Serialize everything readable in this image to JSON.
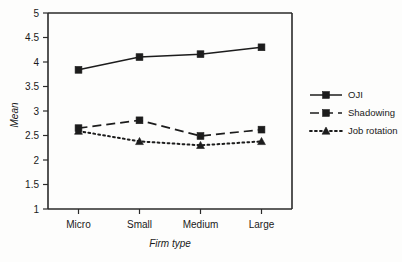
{
  "chart_data": {
    "type": "line",
    "title": "",
    "subtitle": "",
    "xlabel": "Firm type",
    "ylabel": "Mean",
    "categories": [
      "Micro",
      "Small",
      "Medium",
      "Large"
    ],
    "ylim": [
      1,
      5
    ],
    "yticks": [
      "1",
      "1.5",
      "2",
      "2.5",
      "3",
      "3.5",
      "4",
      "4.5",
      "5"
    ],
    "ytick_values": [
      1,
      1.5,
      2,
      2.5,
      3,
      3.5,
      4,
      4.5,
      5
    ],
    "grid": false,
    "legend_position": "right",
    "series": [
      {
        "name": "OJI",
        "values": [
          3.84,
          4.1,
          4.16,
          4.3
        ],
        "line_style": "solid",
        "marker": "square",
        "color": "#1c1c1c"
      },
      {
        "name": "Shadowing",
        "values": [
          2.65,
          2.81,
          2.49,
          2.62
        ],
        "line_style": "dashed",
        "marker": "square",
        "color": "#1c1c1c"
      },
      {
        "name": "Job rotation",
        "values": [
          2.59,
          2.38,
          2.3,
          2.38
        ],
        "line_style": "dotted",
        "marker": "triangle",
        "color": "#1c1c1c"
      }
    ]
  },
  "legend": {
    "items": [
      {
        "label": "OJI"
      },
      {
        "label": "Shadowing"
      },
      {
        "label": "Job rotation"
      }
    ]
  },
  "axes": {
    "y_title": "Mean",
    "x_title": "Firm type"
  }
}
